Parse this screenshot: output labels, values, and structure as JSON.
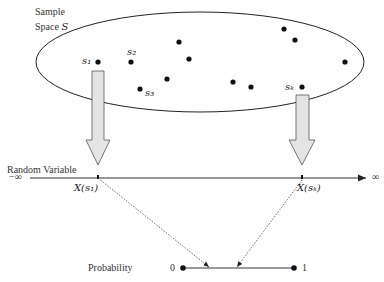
{
  "sample_space": {
    "label_line1": "Sample",
    "label_line2": "Space",
    "symbol": "S",
    "outcomes": [
      {
        "label": "s₁",
        "x": 98,
        "y": 62
      },
      {
        "label": "s₂",
        "x": 131,
        "y": 62
      },
      {
        "label": "s₃",
        "x": 140,
        "y": 89
      },
      {
        "label": "sₖ",
        "x": 302,
        "y": 87
      }
    ],
    "unlabeled_points": [
      {
        "x": 179,
        "y": 42
      },
      {
        "x": 189,
        "y": 59
      },
      {
        "x": 167,
        "y": 79
      },
      {
        "x": 233,
        "y": 82
      },
      {
        "x": 251,
        "y": 87
      },
      {
        "x": 284,
        "y": 29
      },
      {
        "x": 295,
        "y": 40
      },
      {
        "x": 345,
        "y": 62
      }
    ]
  },
  "random_variable": {
    "label": "Random Variable",
    "neg_inf": "−∞",
    "pos_inf": "∞",
    "x_s1": "X(s₁)",
    "x_sk": "X(sₖ)"
  },
  "probability": {
    "label": "Probability",
    "min": "0",
    "max": "1"
  }
}
